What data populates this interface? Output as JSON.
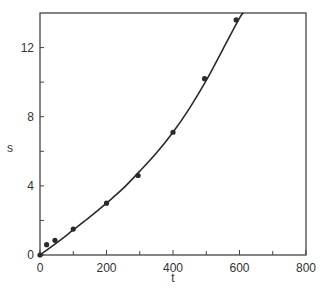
{
  "chart_data": {
    "type": "scatter",
    "title": "",
    "xlabel": "t",
    "ylabel": "s",
    "xlim": [
      0,
      800
    ],
    "ylim": [
      0,
      14
    ],
    "grid": false,
    "legend": null,
    "x_ticks": [
      0,
      200,
      400,
      600,
      800
    ],
    "x_minor_ticks": [
      100,
      300,
      500,
      700
    ],
    "y_ticks": [
      0,
      4,
      8,
      12
    ],
    "y_minor_ticks": [
      2,
      6,
      10
    ],
    "series": [
      {
        "name": "measured",
        "style": "points",
        "color": "#2a2a2a",
        "x": [
          0,
          20,
          45,
          100,
          200,
          295,
          400,
          495,
          590
        ],
        "y": [
          0,
          0.6,
          0.85,
          1.5,
          3.0,
          4.6,
          7.1,
          10.2,
          13.6
        ]
      },
      {
        "name": "fitted curve",
        "style": "line",
        "color": "#2a2a2a",
        "x": [
          0,
          50,
          100,
          150,
          200,
          250,
          300,
          350,
          400,
          450,
          500,
          550,
          600,
          612
        ],
        "y": [
          0,
          0.7,
          1.45,
          2.2,
          3.0,
          3.85,
          4.85,
          5.9,
          7.1,
          8.5,
          10.1,
          11.9,
          13.7,
          14.0
        ]
      }
    ]
  }
}
